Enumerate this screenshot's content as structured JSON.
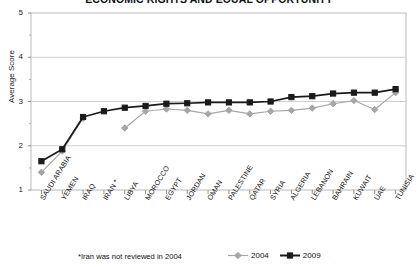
{
  "chart_data": {
    "type": "line",
    "title": "ECONOMIC RIGHTS AND EQUAL OPPORTUNITY",
    "xlabel": "",
    "ylabel": "Average Score",
    "ylim": [
      1,
      5
    ],
    "yticks": [
      1,
      2,
      3,
      4,
      5
    ],
    "ytick_labels": [
      "1",
      "2",
      "3",
      "4",
      "5"
    ],
    "grid": true,
    "legend_position": "bottom-right",
    "categories": [
      "SAUDI ARABIA",
      "YEMEN",
      "IRAQ",
      "IRAN *",
      "LIBYA",
      "MOROCCO",
      "EGYPT",
      "JORDAN",
      "OMAN",
      "PALESTINE",
      "QATAR",
      "SYRIA",
      "ALGERIA",
      "LEBANON",
      "BAHRAIN",
      "KUWAIT",
      "UAE",
      "TUNISIA"
    ],
    "series": [
      {
        "name": "2004",
        "color": "#a6a6a6",
        "marker": "diamond",
        "values": [
          1.4,
          1.88,
          2.62,
          null,
          2.4,
          2.78,
          2.83,
          2.8,
          2.72,
          2.8,
          2.72,
          2.78,
          2.8,
          2.85,
          2.95,
          3.02,
          2.82,
          3.2
        ]
      },
      {
        "name": "2009",
        "color": "#1a1a1a",
        "marker": "square",
        "values": [
          1.65,
          1.92,
          2.65,
          2.78,
          2.86,
          2.9,
          2.95,
          2.96,
          2.98,
          2.98,
          2.98,
          3.0,
          3.1,
          3.12,
          3.18,
          3.2,
          3.2,
          3.28
        ]
      }
    ],
    "annotations": [
      "*Iran was not reviewed in 2004"
    ]
  },
  "chart": {
    "title": "ECONOMIC RIGHTS AND EQUAL OPPORTUNITY",
    "y_axis_title": "Average Score",
    "footnote": "*Iran was not reviewed in 2004",
    "legend": [
      {
        "label": "2004",
        "color": "#a6a6a6",
        "marker": "diamond"
      },
      {
        "label": "2009",
        "color": "#1a1a1a",
        "marker": "square"
      }
    ]
  }
}
